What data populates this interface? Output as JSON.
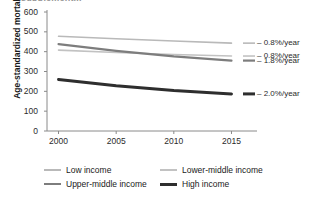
{
  "figure": {
    "cropped_heading": "...supplement..."
  },
  "chart_data": {
    "type": "line",
    "title": "",
    "xlabel": "",
    "ylabel": "Age-standardized mortality rate",
    "xlim": [
      1999,
      2016
    ],
    "ylim": [
      0,
      600
    ],
    "grid": false,
    "legend_position": "bottom",
    "xticks": [
      "2000",
      "2005",
      "2010",
      "2015"
    ],
    "xtick_values": [
      2000,
      2005,
      2010,
      2015
    ],
    "yticks": [
      "0",
      "100",
      "200",
      "300",
      "400",
      "500",
      "600"
    ],
    "ytick_values": [
      0,
      100,
      200,
      300,
      400,
      500,
      600
    ],
    "x": [
      2000,
      2005,
      2010,
      2015
    ],
    "series": [
      {
        "name": "Low income",
        "values": [
          478,
          465,
          454,
          443
        ],
        "color": "#b9b9b9",
        "width": 1.6,
        "annotation": "– 0.8%/year"
      },
      {
        "name": "Lower-middle income",
        "values": [
          408,
          396,
          386,
          378
        ],
        "color": "#c2c2c2",
        "width": 1.6,
        "annotation": "– 0.8%/year"
      },
      {
        "name": "Upper-middle income",
        "values": [
          438,
          404,
          376,
          355
        ],
        "color": "#7d7d7d",
        "width": 2.2,
        "annotation": "– 1.8%/year"
      },
      {
        "name": "High income",
        "values": [
          260,
          228,
          204,
          187
        ],
        "color": "#2e2e2e",
        "width": 3.0,
        "annotation": "– 2.0%/year"
      }
    ],
    "annotations": [
      "– 0.8%/year",
      "– 0.8%/year",
      "– 1.8%/year",
      "– 2.0%/year"
    ],
    "legend": [
      "Low income",
      "Lower-middle income",
      "Upper-middle income",
      "High income"
    ],
    "axis_color": "#8a8a8a"
  }
}
